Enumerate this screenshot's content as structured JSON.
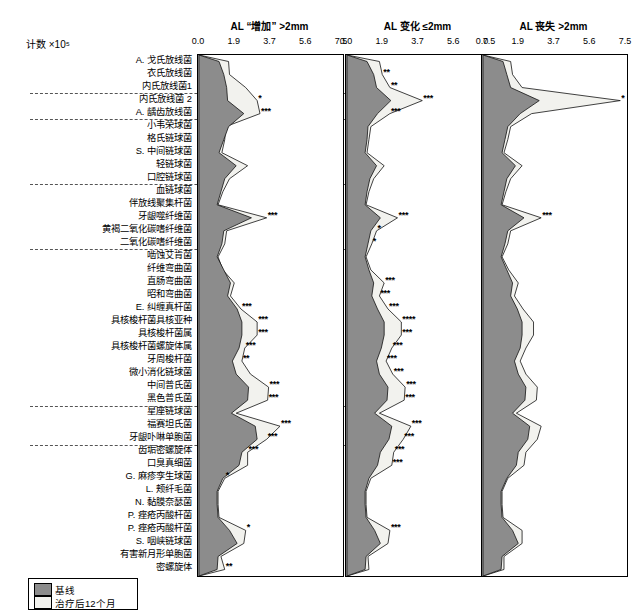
{
  "count_label": "计数 ×10⁵",
  "panels": [
    {
      "title": "AL “增加” >2mm"
    },
    {
      "title": "AL 变化 ≤2mm"
    },
    {
      "title": "AL 丧失 >2mm"
    }
  ],
  "axis_ticks": [
    "0.0",
    "1.9",
    "3.7",
    "5.6",
    "7.5"
  ],
  "legend": [
    {
      "label": "基线",
      "color": "#8c8c8c"
    },
    {
      "label": "治疗后12个月",
      "color": "#f2f2ee"
    }
  ],
  "groups": [
    {
      "name": "放线菌属",
      "color": "#000000"
    },
    {
      "name": "紫色",
      "color": "#000000"
    },
    {
      "name": "黄色",
      "color": "#000000"
    },
    {
      "name": "绿色",
      "color": "#000000"
    },
    {
      "name": "橙色",
      "color": "#000000"
    },
    {
      "name": "红色",
      "color": "#000000"
    },
    {
      "name": "其他",
      "color": "#000000"
    }
  ],
  "chart_data": {
    "type": "area",
    "title": "",
    "xlabel": "计数 ×10⁵",
    "ylabel": "",
    "xlim": [
      0.0,
      7.5
    ],
    "xticks": [
      0.0,
      1.9,
      3.7,
      5.6,
      7.5
    ],
    "grid": false,
    "legend_position": "bottom-left",
    "series": [
      {
        "name": "基线",
        "color": "#8c8c8c"
      },
      {
        "name": "治疗后12个月",
        "color": "#f2f2ee"
      }
    ],
    "categories": [
      "A. 戈氏放线菌",
      "衣氏放线菌",
      "内氏放线菌1",
      "内氏放线菌 2",
      "A. 龋齿放线菌",
      "小韦荣球菌",
      "格氏链球菌",
      "S. 中间链球菌",
      "轻链球菌",
      "口腔链球菌",
      "血链球菌",
      "伴放线聚集杆菌",
      "牙龈噬纤维菌",
      "黄褐二氧化碳嗜纤维菌",
      "二氧化碳嗜纤维菌",
      "啮蚀艾肯菌",
      "纤维弯曲菌",
      "直肠弯曲菌",
      "昭和弯曲菌",
      "E. 纠缠真杆菌",
      "具核梭杆菌具核亚种",
      "具核梭杆菌属",
      "具核梭杆菌螺旋体属",
      "牙周梭杆菌",
      "微小消化链球菌",
      "中间普氏菌",
      "黑色普氏菌",
      "星座链球菌",
      "福赛坦氏菌",
      "牙龈卟啉单胞菌",
      "齿垢密螺旋体",
      "口臭真细菌",
      "G. 麻疹孪生球菌",
      "L. 颊纤毛菌",
      "N. 黏膜奈瑟菌",
      "P. 痤疮丙酸杆菌",
      "P. 痤疮丙酸杆菌",
      "S. 咽峡链球菌",
      "有害新月形单胞菌",
      "密螺旋体"
    ],
    "panels": [
      {
        "title": "AL “增加” >2mm",
        "baseline": [
          1.05,
          1.3,
          1.45,
          1.5,
          2.35,
          1.55,
          1.3,
          1.05,
          1.95,
          1.35,
          1.15,
          0.95,
          2.75,
          1.3,
          1.2,
          0.95,
          1.3,
          1.65,
          1.5,
          2.0,
          2.25,
          2.25,
          2.1,
          1.75,
          1.95,
          2.6,
          2.55,
          1.7,
          2.95,
          3.05,
          2.25,
          2.1,
          1.25,
          0.95,
          0.95,
          1.0,
          1.6,
          2.0,
          1.0,
          0.95
        ],
        "post12": [
          1.55,
          1.6,
          2.45,
          3.05,
          3.2,
          1.4,
          1.35,
          1.2,
          2.55,
          1.6,
          1.25,
          1.0,
          3.55,
          1.45,
          1.35,
          1.0,
          1.25,
          1.85,
          1.65,
          2.2,
          3.05,
          3.05,
          2.4,
          2.25,
          2.7,
          3.65,
          3.6,
          1.95,
          4.25,
          3.55,
          2.55,
          2.55,
          1.35,
          1.0,
          1.0,
          1.05,
          2.45,
          2.35,
          1.15,
          1.35
        ],
        "significance": [
          "",
          "",
          "",
          "*",
          "***",
          "",
          "",
          "",
          "",
          "",
          "",
          "",
          "***",
          "",
          "",
          "",
          "",
          "",
          "",
          "***",
          "***",
          "***",
          "***",
          "**",
          "",
          "***",
          "***",
          "",
          "***",
          "***",
          "***",
          "",
          "*",
          "",
          "",
          "",
          "*",
          "",
          "",
          "**"
        ]
      },
      {
        "title": "AL 变化 ≤2mm",
        "baseline": [
          1.05,
          1.4,
          1.55,
          2.3,
          1.6,
          1.1,
          1.05,
          0.95,
          1.55,
          1.2,
          1.05,
          0.95,
          1.75,
          1.25,
          1.1,
          0.95,
          1.15,
          1.4,
          1.3,
          1.6,
          1.95,
          1.95,
          1.8,
          1.55,
          1.7,
          2.15,
          2.1,
          1.45,
          2.35,
          2.2,
          1.75,
          1.6,
          1.15,
          0.95,
          0.95,
          1.0,
          1.45,
          1.75,
          1.0,
          0.95
        ],
        "post12": [
          1.7,
          1.85,
          2.25,
          3.95,
          2.25,
          1.25,
          1.15,
          1.05,
          1.95,
          1.4,
          1.15,
          1.0,
          2.65,
          1.55,
          1.3,
          1.0,
          1.25,
          1.95,
          1.7,
          2.15,
          2.85,
          2.85,
          2.35,
          2.05,
          2.4,
          3.05,
          3.0,
          1.7,
          3.35,
          2.95,
          2.45,
          2.35,
          1.25,
          1.0,
          1.0,
          1.05,
          2.25,
          2.15,
          1.1,
          1.15
        ],
        "significance": [
          "",
          "**",
          "**",
          "***",
          "***",
          "",
          "",
          "",
          "",
          "",
          "",
          "",
          "***",
          "*",
          "*",
          "",
          "",
          "***",
          "***",
          "***",
          "****",
          "***",
          "***",
          "***",
          "***",
          "***",
          "***",
          "",
          "***",
          "***",
          "***",
          "***",
          "",
          "",
          "",
          "",
          "***",
          "",
          "",
          ""
        ]
      },
      {
        "title": "AL 丧失 >2mm",
        "baseline": [
          1.05,
          1.25,
          1.45,
          2.95,
          1.95,
          1.3,
          1.15,
          1.0,
          1.7,
          1.25,
          1.1,
          0.95,
          2.15,
          1.3,
          1.15,
          0.95,
          1.25,
          1.55,
          1.45,
          1.8,
          2.05,
          2.05,
          1.95,
          1.65,
          1.85,
          2.25,
          2.2,
          1.55,
          2.45,
          2.35,
          1.85,
          1.75,
          1.25,
          0.95,
          0.95,
          1.0,
          1.55,
          1.85,
          1.0,
          0.95
        ],
        "post12": [
          1.45,
          1.55,
          2.05,
          7.2,
          2.55,
          1.45,
          1.3,
          1.1,
          2.05,
          1.45,
          1.2,
          1.0,
          3.05,
          1.45,
          1.3,
          1.0,
          1.35,
          1.85,
          1.65,
          2.1,
          2.65,
          2.65,
          2.25,
          1.95,
          2.25,
          2.85,
          2.8,
          1.75,
          3.05,
          2.85,
          2.25,
          2.15,
          1.3,
          1.0,
          1.0,
          1.05,
          2.05,
          2.05,
          1.1,
          1.1
        ],
        "significance": [
          "",
          "",
          "",
          "*",
          "",
          "",
          "",
          "",
          "",
          "",
          "",
          "",
          "***",
          "",
          "",
          "",
          "",
          "",
          "",
          "",
          "",
          "",
          "",
          "",
          "",
          "",
          "",
          "",
          "",
          "",
          "",
          "",
          "",
          "",
          "",
          "",
          "",
          "",
          "",
          ""
        ]
      }
    ]
  }
}
